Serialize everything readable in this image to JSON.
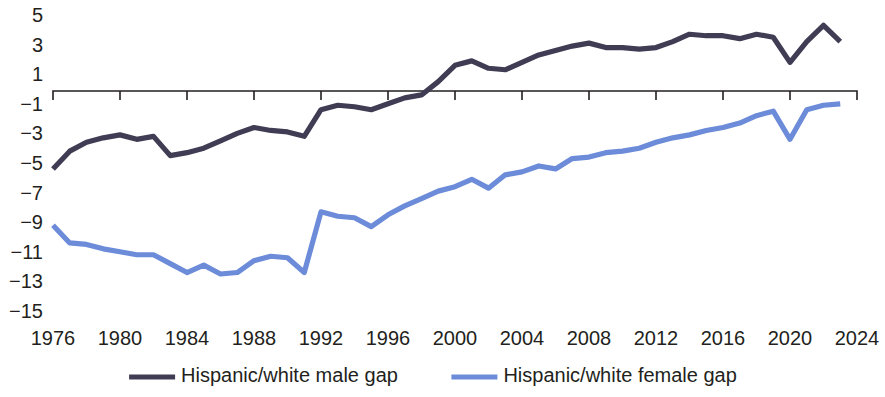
{
  "chart_data": {
    "type": "line",
    "title": "",
    "subtitle": "",
    "xlabel": "",
    "ylabel": "",
    "xlim": [
      1976,
      2024
    ],
    "ylim": [
      -15,
      5
    ],
    "x_ticks": [
      1976,
      1980,
      1984,
      1988,
      1992,
      1996,
      2000,
      2004,
      2008,
      2012,
      2016,
      2020,
      2024
    ],
    "y_ticks": [
      5,
      3,
      1,
      -1,
      -3,
      -5,
      -7,
      -9,
      -11,
      -13,
      -15
    ],
    "y_tick_labels": [
      "5",
      "3",
      "1",
      "−1",
      "−3",
      "−5",
      "−7",
      "−9",
      "−11",
      "−13",
      "−15"
    ],
    "x_tick_labels": [
      "1976",
      "1980",
      "1984",
      "1988",
      "1992",
      "1996",
      "2000",
      "2004",
      "2008",
      "2012",
      "2016",
      "2020",
      "2024"
    ],
    "grid": false,
    "zero_axis": true,
    "legend_position": "bottom",
    "x": [
      1976,
      1977,
      1978,
      1979,
      1980,
      1981,
      1982,
      1983,
      1984,
      1985,
      1986,
      1987,
      1988,
      1989,
      1990,
      1991,
      1992,
      1993,
      1994,
      1995,
      1996,
      1997,
      1998,
      1999,
      2000,
      2001,
      2002,
      2003,
      2004,
      2005,
      2006,
      2007,
      2008,
      2009,
      2010,
      2011,
      2012,
      2013,
      2014,
      2015,
      2016,
      2017,
      2018,
      2019,
      2020,
      2021,
      2022,
      2023
    ],
    "series": [
      {
        "name": "Hispanic/white male gap",
        "color": "#3f3c53",
        "values": [
          -5.4,
          -4.2,
          -3.6,
          -3.3,
          -3.1,
          -3.4,
          -3.2,
          -4.5,
          -4.3,
          -4.0,
          -3.5,
          -3.0,
          -2.6,
          -2.8,
          -2.9,
          -3.2,
          -1.4,
          -1.1,
          -1.2,
          -1.4,
          -1.0,
          -0.6,
          -0.4,
          0.5,
          1.6,
          1.9,
          1.4,
          1.3,
          1.8,
          2.3,
          2.6,
          2.9,
          3.1,
          2.8,
          2.8,
          2.7,
          2.8,
          3.2,
          3.7,
          3.6,
          3.6,
          3.4,
          3.7,
          3.5,
          1.8,
          3.2,
          4.3,
          3.2
        ]
      },
      {
        "name": "Hispanic/white female gap",
        "color": "#6c8bd9",
        "values": [
          -9.2,
          -10.4,
          -10.5,
          -10.8,
          -11.0,
          -11.2,
          -11.2,
          -11.8,
          -12.4,
          -11.9,
          -12.5,
          -12.4,
          -11.6,
          -11.3,
          -11.4,
          -12.4,
          -8.3,
          -8.6,
          -8.7,
          -9.3,
          -8.5,
          -7.9,
          -7.4,
          -6.9,
          -6.6,
          -6.1,
          -6.7,
          -5.8,
          -5.6,
          -5.2,
          -5.4,
          -4.7,
          -4.6,
          -4.3,
          -4.2,
          -4.0,
          -3.6,
          -3.3,
          -3.1,
          -2.8,
          -2.6,
          -2.3,
          -1.8,
          -1.5,
          -3.4,
          -1.4,
          -1.1,
          -1.0
        ]
      }
    ]
  },
  "legend": {
    "items": [
      {
        "label": "Hispanic/white male gap",
        "color": "#3f3c53"
      },
      {
        "label": "Hispanic/white female gap",
        "color": "#6c8bd9"
      }
    ]
  },
  "plot_geometry": {
    "x_left_px": 53,
    "x_right_px": 857,
    "y_top_value": 5,
    "y_top_px": 15,
    "y_bottom_value": -15,
    "y_bottom_px": 311,
    "axis_y_px": 91,
    "tick_length_px": 9,
    "x_label_y_px": 345,
    "legend_y_px": 377
  }
}
